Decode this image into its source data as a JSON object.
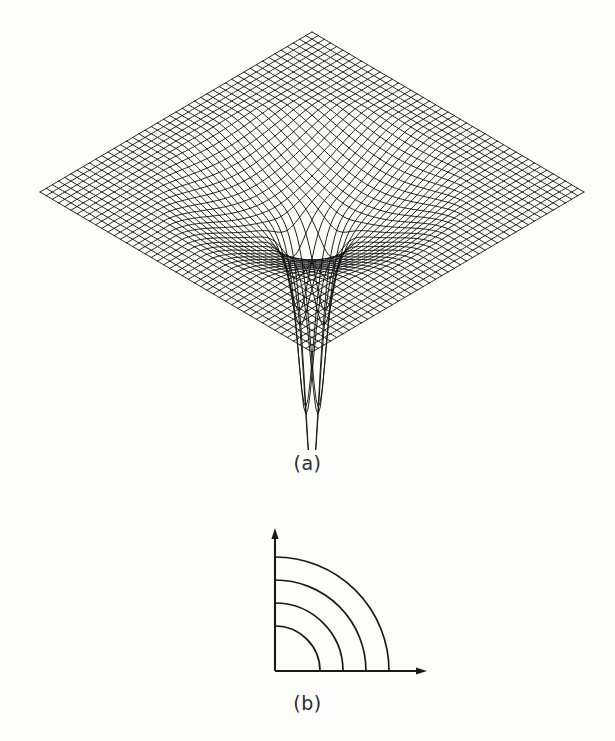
{
  "figure": {
    "background_color": "#fdfdfc",
    "ink_color": "#141414",
    "panels": [
      {
        "id": "a",
        "caption": "(a)",
        "description": "3D wireframe mesh surface plot of a radially symmetric potential well with a central downward singular spike"
      },
      {
        "id": "b",
        "caption": "(b)",
        "description": "Contour plot in the first quadrant showing four concentric quarter-circle level curves"
      }
    ]
  },
  "captions": {
    "panel_a": "(a)",
    "panel_b": "(b)"
  },
  "chart_data": [
    {
      "id": "panel-a",
      "type": "surface",
      "title": "(a)",
      "xlabel": "",
      "ylabel": "",
      "zlabel": "",
      "grid": true,
      "legend": "none",
      "projection": "isometric-wireframe",
      "mesh_divisions_u": 44,
      "mesh_divisions_v": 44,
      "domain_x": [
        -1,
        1
      ],
      "domain_y": [
        -1,
        1
      ],
      "zlim": [
        -3.6,
        0
      ],
      "surface_formula": "z(r) = -A / (r^2 + e^2) style inverse-square potential well; flat plateau at z=0 far field, broad circular basin, central narrow downward spike",
      "parameters": {
        "well_amplitude": 0.58,
        "well_radius": 0.46,
        "spike_amplitude": 3.1,
        "spike_radius": 0.085,
        "plateau_level": 0.0
      },
      "projection_params": {
        "azimuth_deg": 45,
        "elevation_deg": 26,
        "center_px": [
          312,
          192
        ],
        "half_width_px": 272,
        "half_depth_px": 160,
        "z_scale_px": 78
      },
      "diamond_corners_px": {
        "left": [
          40,
          192
        ],
        "top": [
          311,
          33
        ],
        "right": [
          585,
          192
        ],
        "front": [
          311,
          352
        ]
      },
      "spike_tip_px": [
        311,
        436
      ]
    },
    {
      "id": "panel-b",
      "type": "contour",
      "title": "(b)",
      "xlabel": "",
      "ylabel": "",
      "grid": false,
      "legend": "none",
      "quadrant": "first",
      "origin_px": [
        275,
        671
      ],
      "x_axis_end_px": [
        427,
        671
      ],
      "y_axis_end_px": [
        275,
        528
      ],
      "contour_count": 4,
      "contour_radii_px": [
        45,
        68,
        91,
        114
      ],
      "contour_levels": [
        4,
        3,
        2,
        1
      ],
      "arc_span_deg": 90,
      "axes_have_arrowheads": true
    }
  ]
}
